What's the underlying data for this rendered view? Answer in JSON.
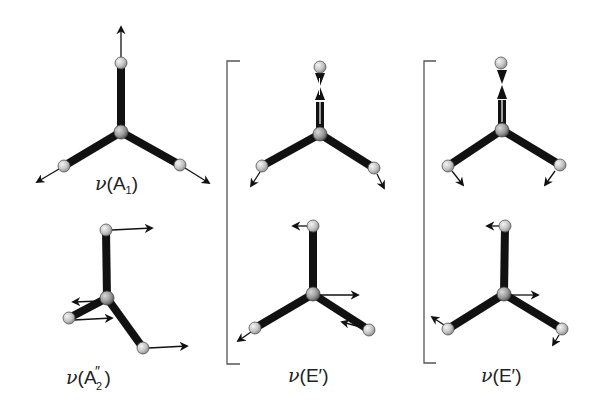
{
  "figure": {
    "colors": {
      "bond": "#111111",
      "atom_fill": "#c8c8c8",
      "atom_stroke": "#555555",
      "arrow": "#111111",
      "bracket": "#555555",
      "background": "#ffffff"
    }
  },
  "modes": [
    {
      "id": "A1",
      "label_prefix": "ν(",
      "label_main": "A",
      "label_sub": "1",
      "label_sup": "",
      "label_suffix": ")",
      "position": "top-left"
    },
    {
      "id": "A2pp",
      "label_prefix": "ν(",
      "label_main": "A",
      "label_sub": "2",
      "label_sup": "″",
      "label_suffix": ")",
      "position": "bottom-left"
    },
    {
      "id": "E1",
      "label_prefix": "ν(",
      "label_main": "E′",
      "label_suffix": ")",
      "position": "middle column (degenerate pair)"
    },
    {
      "id": "E2",
      "label_prefix": "ν(",
      "label_main": "E′",
      "label_suffix": ")",
      "position": "right column (degenerate pair)"
    }
  ],
  "labels": {
    "a1": {
      "nu": "ν",
      "open": "(",
      "main": "A",
      "sub": "1",
      "close": ")"
    },
    "a2": {
      "nu": "ν",
      "open": "(",
      "main": "A",
      "sup": "″",
      "sub": "2",
      "close": ")"
    },
    "e_mid": {
      "nu": "ν",
      "open": "(",
      "main": "E′",
      "close": ")"
    },
    "e_right": {
      "nu": "ν",
      "open": "(",
      "main": "E′",
      "close": ")"
    }
  }
}
